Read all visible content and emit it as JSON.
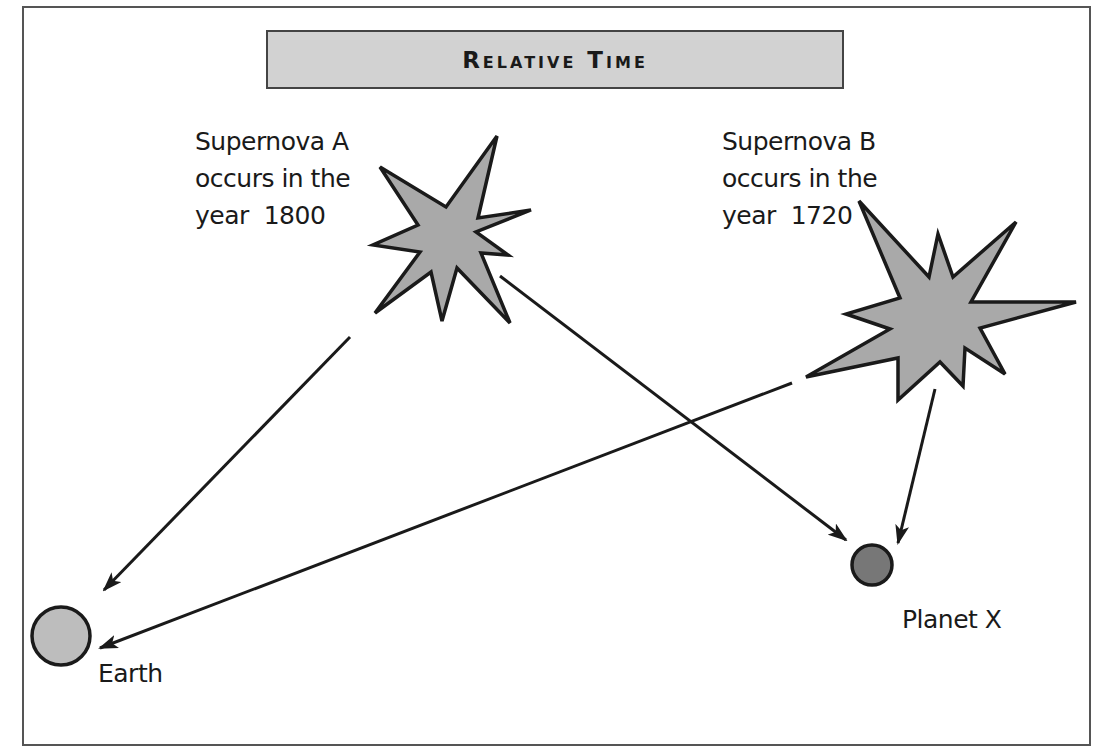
{
  "title": "Relative Time",
  "supernova_a": {
    "lines": [
      "Supernova A",
      "occurs in the",
      "year  1800"
    ],
    "name": "Supernova A",
    "year": "1800"
  },
  "supernova_b": {
    "lines": [
      "Supernova B",
      "occurs in the",
      "year  1720"
    ],
    "name": "Supernova B",
    "year": "1720"
  },
  "earth": {
    "label": "Earth"
  },
  "planet_x": {
    "label": "Planet X"
  },
  "colors": {
    "star_fill": "#a9a9a9",
    "earth_fill": "#bdbdbd",
    "planet_x_fill": "#777777",
    "title_bg": "#d2d2d2",
    "stroke": "#1a1a1a"
  },
  "arrows": [
    {
      "from": "Supernova A",
      "to": "Earth"
    },
    {
      "from": "Supernova A",
      "to": "Planet X"
    },
    {
      "from": "Supernova B",
      "to": "Earth"
    },
    {
      "from": "Supernova B",
      "to": "Planet X"
    }
  ]
}
